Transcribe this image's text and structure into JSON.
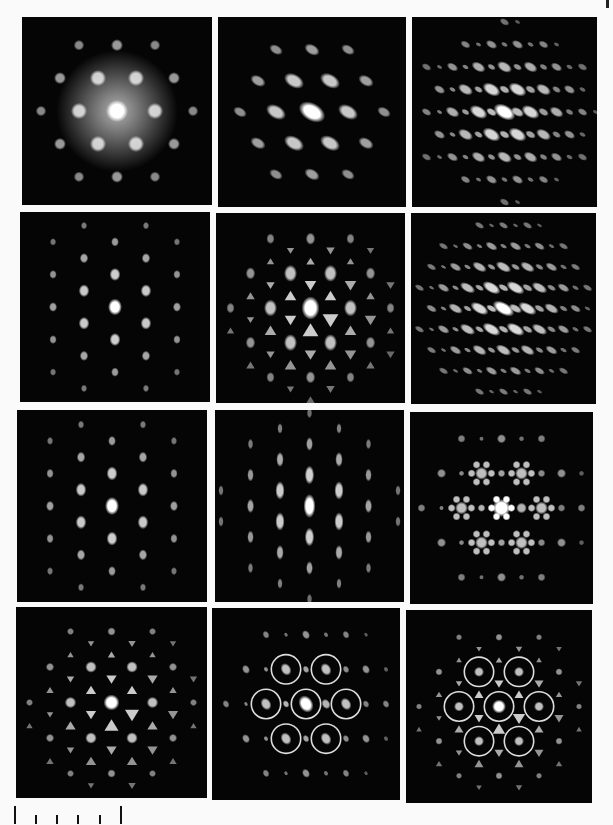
{
  "figure": {
    "background": "#fafafa",
    "panel_background": "#050505",
    "spot_color": "#ffffff",
    "rows": 4,
    "cols": 3,
    "panels": [
      {
        "id": "r1c1",
        "x": 22,
        "y": 17,
        "w": 190,
        "h": 188,
        "pattern": "hex",
        "scale": 38,
        "spot": 11,
        "elong": 1.0,
        "rot": 0,
        "glow": true
      },
      {
        "id": "r1c2",
        "x": 218,
        "y": 17,
        "w": 188,
        "h": 190,
        "pattern": "hex-oblique",
        "scale": 36,
        "spot": 9,
        "elong": 1.6,
        "rot": -60,
        "glow": false
      },
      {
        "id": "r1c3",
        "x": 412,
        "y": 17,
        "w": 185,
        "h": 190,
        "pattern": "hex-oblique-dense",
        "scale": 26,
        "spot": 7,
        "elong": 1.7,
        "rot": -60,
        "glow": false
      },
      {
        "id": "r2c1",
        "x": 20,
        "y": 212,
        "w": 190,
        "h": 190,
        "pattern": "rect",
        "scale": 21,
        "spot": 7,
        "elong": 1.2,
        "rot": 0,
        "glow": false
      },
      {
        "id": "r2c2",
        "x": 216,
        "y": 213,
        "w": 189,
        "h": 190,
        "pattern": "hex-tri",
        "scale": 40,
        "spot": 9,
        "elong": 1.3,
        "rot": 0,
        "glow": false
      },
      {
        "id": "r2c3",
        "x": 411,
        "y": 213,
        "w": 185,
        "h": 191,
        "pattern": "hex-oblique-dense",
        "scale": 24,
        "spot": 6,
        "elong": 2.0,
        "rot": -60,
        "glow": false
      },
      {
        "id": "r3c1",
        "x": 17,
        "y": 410,
        "w": 190,
        "h": 192,
        "pattern": "rect",
        "scale": 21,
        "spot": 7,
        "elong": 1.3,
        "rot": 0,
        "glow": false
      },
      {
        "id": "r3c2",
        "x": 215,
        "y": 410,
        "w": 189,
        "h": 192,
        "pattern": "rect-elongated",
        "scale": 20,
        "spot": 6,
        "elong": 2.0,
        "rot": 0,
        "glow": false
      },
      {
        "id": "r3c3",
        "x": 410,
        "y": 412,
        "w": 183,
        "h": 192,
        "pattern": "hex-star",
        "scale": 40,
        "spot": 9,
        "elong": 1.0,
        "rot": 0,
        "glow": false
      },
      {
        "id": "r4c1",
        "x": 16,
        "y": 607,
        "w": 191,
        "h": 191,
        "pattern": "hex-tri",
        "scale": 41,
        "spot": 8,
        "elong": 1.0,
        "rot": 0,
        "glow": false
      },
      {
        "id": "r4c2",
        "x": 212,
        "y": 608,
        "w": 188,
        "h": 192,
        "pattern": "hex-ring-oblique",
        "scale": 40,
        "spot": 7,
        "elong": 1.3,
        "rot": -30,
        "glow": false
      },
      {
        "id": "r4c3",
        "x": 406,
        "y": 610,
        "w": 186,
        "h": 193,
        "pattern": "hex-ring",
        "scale": 40,
        "spot": 7,
        "elong": 1.0,
        "rot": 0,
        "glow": false
      }
    ]
  },
  "scale_bar": {
    "divisions": 5,
    "x": 14,
    "y": 804,
    "width": 110
  }
}
